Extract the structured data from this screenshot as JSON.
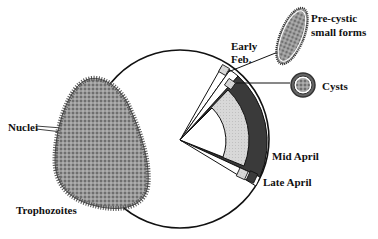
{
  "diagram": {
    "type": "life-cycle clock diagram",
    "colors": {
      "outline": "#111111",
      "dark_band": "#3a3a3a",
      "light_band": "#d4d4d4",
      "organism_fill": "#8a8a8a",
      "background": "#ffffff"
    },
    "labels": {
      "nuclei": "Nuclei",
      "trophozoites": "Trophozoites",
      "early_feb": "Early Feb.",
      "early": "Early",
      "feb": "Feb.",
      "precystic_line1": "Pre-cystic",
      "precystic_line2": "small forms",
      "cysts": "Cysts",
      "mid_april": "Mid April",
      "late_april": "Late April"
    },
    "stages": [
      {
        "name": "Trophozoites",
        "icon": "trophozoite-cell-icon"
      },
      {
        "name": "Pre-cystic small forms",
        "icon": "precystic-cell-icon"
      },
      {
        "name": "Cysts",
        "icon": "cyst-icon"
      }
    ],
    "timeline": [
      "Early Feb.",
      "Mid April",
      "Late April"
    ]
  }
}
